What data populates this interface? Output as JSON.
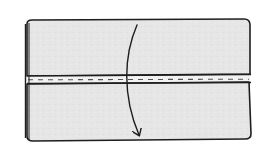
{
  "diagram": {
    "type": "fold-instruction-sketch",
    "description": "Rectangular piece of fabric with a stitched center seam and a curved arrow showing the top half folding down over the bottom half",
    "elements": {
      "top_panel": {
        "label": "top-half"
      },
      "bottom_panel": {
        "label": "bottom-half"
      },
      "seam": {
        "style": "dashed stitch line",
        "orientation": "horizontal"
      },
      "fold_arrow": {
        "direction": "down",
        "shape": "curved"
      },
      "folded_edge": {
        "side": "left"
      }
    },
    "colors": {
      "fill": "#e6e6e6",
      "stroke": "#1e1e1e",
      "seam_strip": "#f2f2f2",
      "background": "#ffffff"
    }
  }
}
